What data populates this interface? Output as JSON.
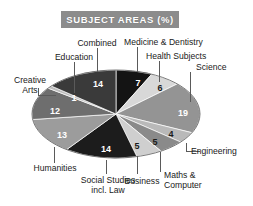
{
  "title": {
    "text": "SUBJECT AREAS (%)",
    "banner_color": "#8c8c8c",
    "text_color": "#ffffff"
  },
  "chart_data": {
    "type": "pie",
    "title": "SUBJECT AREAS (%)",
    "xlabel": "",
    "ylabel": "",
    "units": "percent",
    "total": 100,
    "legend": "none",
    "grid": false,
    "labels_inside_slices": true,
    "categories": [
      "Medicine & Dentistry",
      "Health Subjects",
      "Science",
      "Engineering",
      "Maths & Computer",
      "Business",
      "Social Studies incl. Law",
      "Humanities",
      "Creative Arts",
      "Education",
      "Combined"
    ],
    "values": [
      7,
      6,
      19,
      4,
      5,
      5,
      14,
      13,
      12,
      1,
      14
    ],
    "slices": [
      {
        "label": "Medicine & Dentistry",
        "value": 7,
        "display": "7",
        "color": "#141414",
        "swatch": "near-black"
      },
      {
        "label": "Health Subjects",
        "value": 6,
        "display": "6",
        "color": "#d8d8d8",
        "swatch": "light-gray"
      },
      {
        "label": "Science",
        "value": 19,
        "display": "19",
        "color": "#949494",
        "swatch": "mid-gray"
      },
      {
        "label": "Engineering",
        "value": 4,
        "display": "4",
        "color": "#b9b9b9",
        "swatch": "light-mid-gray"
      },
      {
        "label": "Maths & Computer",
        "value": 5,
        "display": "5",
        "color": "#8a8a8a",
        "swatch": "mid-gray"
      },
      {
        "label": "Business",
        "value": 5,
        "display": "5",
        "color": "#cfcfcf",
        "swatch": "light-gray"
      },
      {
        "label": "Social Studies incl. Law",
        "value": 14,
        "display": "14",
        "color": "#1c1c1c",
        "swatch": "near-black"
      },
      {
        "label": "Humanities",
        "value": 13,
        "display": "13",
        "color": "#9c9c9c",
        "swatch": "mid-gray"
      },
      {
        "label": "Creative Arts",
        "value": 12,
        "display": "12",
        "color": "#6e6e6e",
        "swatch": "dark-gray"
      },
      {
        "label": "Education",
        "value": 1,
        "display": "1",
        "color": "#bdbdbd",
        "swatch": "light-mid-gray"
      },
      {
        "label": "Combined",
        "value": 14,
        "display": "14",
        "color": "#3a3a3a",
        "swatch": "dark-gray"
      }
    ]
  },
  "callouts": {
    "combined": "Combined",
    "medicine": "Medicine & Dentistry",
    "education": "Education",
    "health": "Health Subjects",
    "creative_line1": "Creative",
    "creative_line2": "Arts",
    "science": "Science",
    "humanities": "Humanities",
    "engineering": "Engineering",
    "social_line1": "Social Studies",
    "social_line2": "incl. Law",
    "business": "Business",
    "maths_line1": "Maths &",
    "maths_line2": "Computer"
  }
}
